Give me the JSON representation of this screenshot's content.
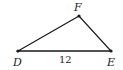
{
  "diagram": {
    "type": "triangle",
    "vertices": [
      {
        "name": "D",
        "x": 18,
        "y": 51
      },
      {
        "name": "E",
        "x": 111,
        "y": 51
      },
      {
        "name": "F",
        "x": 79,
        "y": 16
      }
    ],
    "labels": {
      "D": "D",
      "E": "E",
      "F": "F"
    },
    "sides": [
      {
        "from": "D",
        "to": "E",
        "label": "12"
      }
    ],
    "side_DE_label": "12",
    "stroke_color": "#1a1a1a"
  }
}
